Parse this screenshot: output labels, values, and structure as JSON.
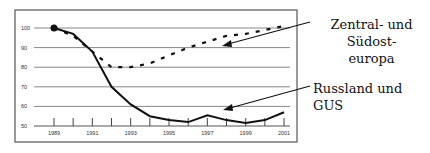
{
  "chart_data": {
    "type": "line",
    "title": "",
    "xlabel": "",
    "ylabel": "",
    "x": [
      1989,
      1990,
      1991,
      1992,
      1993,
      1994,
      1995,
      1996,
      1997,
      1998,
      1999,
      2000,
      2001
    ],
    "x_tick_labels": [
      "1989",
      "1991",
      "1993",
      "1995",
      "1997",
      "1999",
      "2001"
    ],
    "y_tick_labels": [
      "100",
      "90",
      "80",
      "70",
      "60",
      "50"
    ],
    "ylim": [
      50,
      105
    ],
    "grid": "horizontal",
    "series": [
      {
        "name": "Zentral- und Südosteuropa",
        "style": "dashed",
        "values": [
          100,
          96,
          88,
          80,
          80,
          82,
          86,
          90,
          93,
          96,
          97,
          99,
          101
        ]
      },
      {
        "name": "Russland und GUS",
        "style": "solid",
        "values": [
          100,
          97,
          88,
          70,
          61,
          55,
          53,
          52,
          55.5,
          53,
          51.5,
          53,
          57
        ]
      }
    ],
    "annotations": [
      {
        "text": "Zentral- und Südosteuropa",
        "target_series": "Zentral- und Südosteuropa"
      },
      {
        "text": "Russland und GUS",
        "target_series": "Russland und GUS"
      }
    ]
  },
  "annotations": {
    "zentral_line1": "Zentral- und Südost-",
    "zentral_line2": "europa",
    "russland": "Russland und GUS"
  }
}
